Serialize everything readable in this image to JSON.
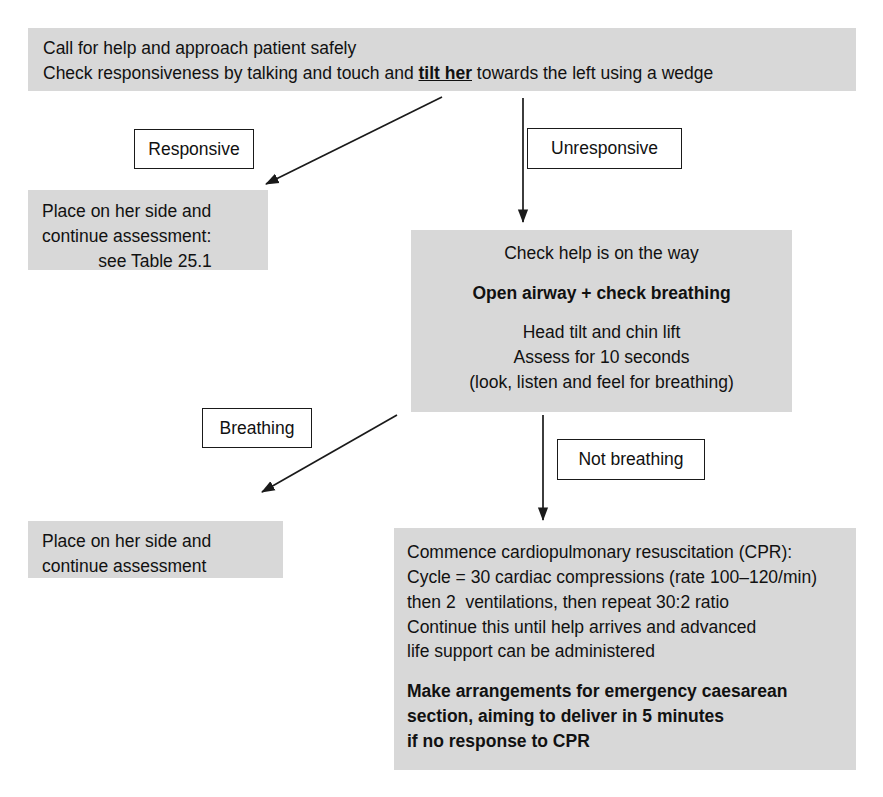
{
  "diagram": {
    "node_fill": "#d8d8d8",
    "stroke": "#1a1a1a",
    "background": "#ffffff"
  },
  "nodes": {
    "top": {
      "id": "call-for-help",
      "lines": [
        {
          "text": "Call for help and approach patient safely",
          "style": "plain"
        },
        {
          "text": "Check responsiveness by talking and touch and ",
          "style": "plain",
          "emphasis": "tilt her",
          "tail": " towards the left using a wedge"
        }
      ]
    },
    "responsive_outcome": {
      "id": "place-on-side-table",
      "lines": [
        {
          "text": "Place on her side and",
          "style": "plain"
        },
        {
          "text": "continue assessment:",
          "style": "plain"
        },
        {
          "text": "see Table 25.1",
          "style": "center"
        }
      ]
    },
    "check_help": {
      "id": "check-help-open-airway",
      "lines": [
        {
          "text": "Check help is on the way",
          "style": "underline"
        },
        {
          "text": "",
          "style": "spacer"
        },
        {
          "text": "Open airway + check breathing",
          "style": "bold"
        },
        {
          "text": "",
          "style": "spacer"
        },
        {
          "text": "Head tilt and chin lift",
          "style": "plain"
        },
        {
          "text": "Assess for 10 seconds",
          "style": "plain"
        },
        {
          "text": "(look, listen and feel for breathing)",
          "style": "plain"
        }
      ]
    },
    "breathing_outcome": {
      "id": "place-on-side",
      "lines": [
        {
          "text": "Place on her side and",
          "style": "plain"
        },
        {
          "text": "continue assessment",
          "style": "plain"
        }
      ]
    },
    "cpr": {
      "id": "commence-cpr",
      "lines": [
        {
          "text": "Commence cardiopulmonary resuscitation (CPR):",
          "style": "underline"
        },
        {
          "text": "Cycle = 30 cardiac compressions (rate 100–120/min)",
          "style": "plain"
        },
        {
          "text": "then 2  ventilations, then repeat 30:2 ratio",
          "style": "plain"
        },
        {
          "text": "Continue this until help arrives and advanced",
          "style": "plain"
        },
        {
          "text": "life support can be administered",
          "style": "plain"
        },
        {
          "text": "",
          "style": "spacer"
        },
        {
          "text": "Make arrangements for emergency caesarean",
          "style": "bold"
        },
        {
          "text": "section, aiming to deliver in 5 minutes",
          "style": "bold"
        },
        {
          "text": "if no response to CPR",
          "style": "bold"
        }
      ]
    }
  },
  "edge_labels": {
    "responsive": "Responsive",
    "unresponsive": "Unresponsive",
    "breathing": "Breathing",
    "not_breathing": "Not breathing"
  },
  "connectors": [
    {
      "name": "top-to-responsive",
      "type": "diagonal-arrow",
      "from": [
        442,
        97
      ],
      "to": [
        262,
        186
      ]
    },
    {
      "name": "top-to-unresponsive",
      "type": "vertical-arrow",
      "from": [
        523,
        98
      ],
      "to": [
        523,
        226
      ]
    },
    {
      "name": "check-help-to-breathing",
      "type": "diagonal-arrow",
      "from": [
        397,
        415
      ],
      "to": [
        258,
        494
      ]
    },
    {
      "name": "check-help-to-cpr",
      "type": "vertical-arrow",
      "from": [
        543,
        415
      ],
      "to": [
        543,
        524
      ]
    }
  ]
}
